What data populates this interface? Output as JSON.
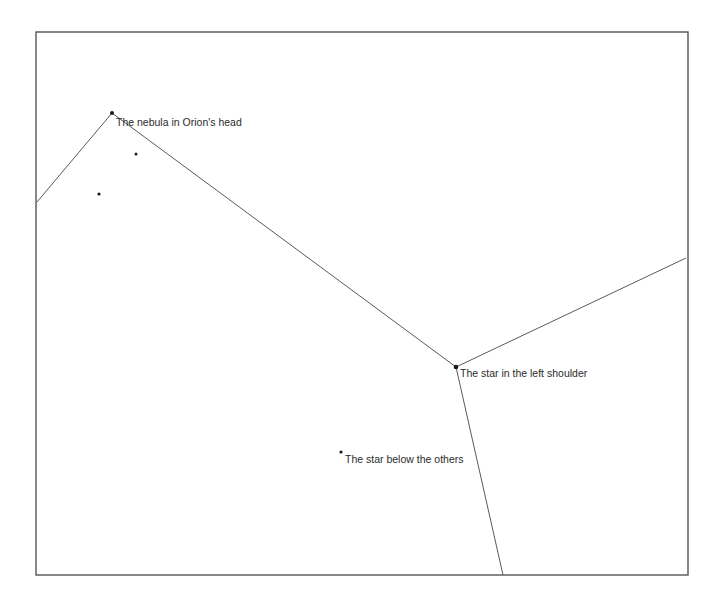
{
  "figure": {
    "background_color": "#ffffff",
    "frame": {
      "stroke_color": "#555555",
      "x": 36,
      "y": 32,
      "width": 652,
      "height": 543
    },
    "line_color": "#5a5a5a",
    "dot_color": "#1a1a1a",
    "text_color": "#2b2b2b"
  },
  "labels": {
    "nebula": "The nebula in Orion's head",
    "left_shoulder": "The star in the left shoulder",
    "below_others": "The star below the others"
  },
  "stars": [
    {
      "name": "nebula-node",
      "x": 112,
      "y": 113,
      "r": 2.0,
      "label_key": "nebula",
      "label_x": 116,
      "label_y": 126
    },
    {
      "name": "left-shoulder-node",
      "x": 456,
      "y": 367,
      "r": 2.3,
      "label_key": "left_shoulder",
      "label_x": 460,
      "label_y": 377
    },
    {
      "name": "below-others-node",
      "x": 341,
      "y": 452,
      "r": 1.6,
      "label_key": "below_others",
      "label_x": 345,
      "label_y": 463
    },
    {
      "name": "faint-star-upper",
      "x": 136,
      "y": 154,
      "r": 1.5,
      "label_key": null,
      "label_x": null,
      "label_y": null
    },
    {
      "name": "faint-star-lower",
      "x": 99,
      "y": 194,
      "r": 1.6,
      "label_key": null,
      "label_x": null,
      "label_y": null
    }
  ],
  "edges": [
    {
      "name": "edge-left-margin-to-nebula",
      "x1": 37,
      "y1": 202,
      "x2": 112,
      "y2": 113
    },
    {
      "name": "edge-nebula-to-left-shoulder",
      "x1": 112,
      "y1": 113,
      "x2": 456,
      "y2": 367
    },
    {
      "name": "edge-left-shoulder-to-right-edge",
      "x1": 456,
      "y1": 367,
      "x2": 686,
      "y2": 258
    },
    {
      "name": "edge-left-shoulder-to-bottom",
      "x1": 456,
      "y1": 367,
      "x2": 503,
      "y2": 575
    }
  ]
}
